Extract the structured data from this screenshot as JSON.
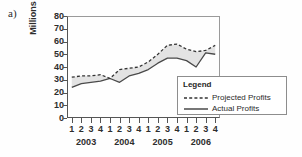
{
  "panel": {
    "label": "a)"
  },
  "chart_data": {
    "type": "line",
    "title": "",
    "subtitle": "",
    "xlabel": "",
    "ylabel": "Millions of Dollars",
    "ylim": [
      0,
      80
    ],
    "y_ticks": [
      80,
      70,
      60,
      50,
      40,
      30,
      20,
      10,
      0
    ],
    "grid": false,
    "legend_position": "inside-lower-right",
    "x_tick_labels": [
      "1",
      "2",
      "3",
      "4",
      "1",
      "2",
      "3",
      "4",
      "1",
      "2",
      "3",
      "4",
      "1",
      "2",
      "3",
      "4"
    ],
    "x_group_labels": [
      "2003",
      "2004",
      "2005",
      "2006"
    ],
    "x": [
      "2003 Q1",
      "2003 Q2",
      "2003 Q3",
      "2003 Q4",
      "2004 Q1",
      "2004 Q2",
      "2004 Q3",
      "2004 Q4",
      "2005 Q1",
      "2005 Q2",
      "2005 Q3",
      "2005 Q4",
      "2006 Q1",
      "2006 Q2",
      "2006 Q3",
      "2006 Q4"
    ],
    "series": [
      {
        "name": "Projected Profits",
        "style": "dashed",
        "color": "#333333",
        "values": [
          32,
          33,
          33,
          34,
          31,
          38,
          39,
          40,
          44,
          50,
          57,
          58,
          54,
          52,
          53,
          57
        ]
      },
      {
        "name": "Actual Profits",
        "style": "solid",
        "color": "#4a4a4a",
        "values": [
          24,
          27,
          28,
          29,
          31,
          28,
          33,
          35,
          38,
          43,
          47,
          47,
          45,
          40,
          51,
          50
        ]
      }
    ],
    "fill_between": {
      "color": "#e2e2e2",
      "between": [
        "Projected Profits",
        "Actual Profits"
      ]
    },
    "annotations": []
  },
  "legend": {
    "title": "Legend",
    "items": [
      {
        "label": "Projected Profits",
        "style": "dashed"
      },
      {
        "label": "Actual Profits",
        "style": "solid"
      }
    ]
  }
}
